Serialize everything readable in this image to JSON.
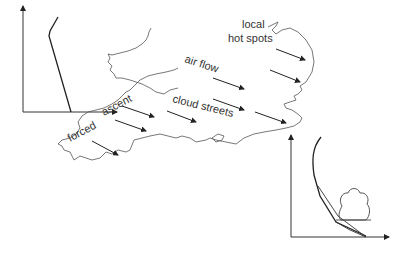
{
  "labels": {
    "local": "local",
    "hot_spots": "hot spots",
    "air_flow": "air flow",
    "cloud_streets": "cloud streets",
    "forced": "forced",
    "ascent": "ascent"
  },
  "colors": {
    "ink": "#222222",
    "coast": "#555555",
    "background": "#ffffff"
  }
}
